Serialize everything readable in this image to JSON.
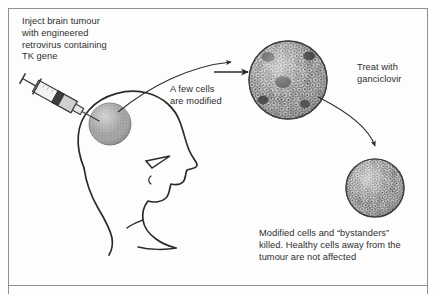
{
  "figure": {
    "frame_color": "#8a8a8a",
    "ink_color": "#2b2b2b",
    "tumour_fill": "#9b9b9b",
    "cell_fill": "#b9b9b9",
    "background": "#fdfdfd"
  },
  "labels": {
    "inject": "Inject brain tumour\nwith engineered\nretrovirus containing\nTK gene",
    "modified": "A few cells\nare modified",
    "treat": "Treat with\nganciclovir",
    "killed": "Modified cells and “bystanders”\nkilled. Healthy cells away from the\ntumour are not affected"
  },
  "caption_cutoff": "",
  "icons": {
    "syringe": "syringe-icon",
    "head": "head-profile-icon",
    "tumour_in_head": "tumour-mass-icon",
    "tumour_sphere_modified": "tumour-cells-modified-icon",
    "tumour_sphere_killed": "tumour-cells-killed-icon",
    "arrow_straight": "arrow-right-icon",
    "arrow_curved_up": "arrow-curve-up-icon",
    "arrow_curved_down": "arrow-curve-down-icon"
  },
  "diagram_steps": [
    {
      "step": 1,
      "name": "inject",
      "description": "Inject brain tumour with engineered retrovirus containing TK gene"
    },
    {
      "step": 2,
      "name": "modify",
      "description": "A few cells are modified"
    },
    {
      "step": 3,
      "name": "treat",
      "description": "Treat with ganciclovir"
    },
    {
      "step": 4,
      "name": "kill",
      "description": "Modified cells and bystanders killed; healthy cells away from the tumour are not affected"
    }
  ]
}
